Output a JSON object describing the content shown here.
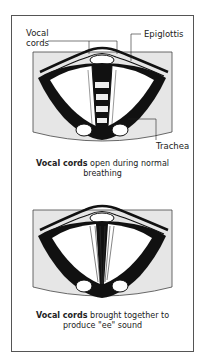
{
  "figure": {
    "panels": [
      {
        "name": "open",
        "labels": {
          "vocal_cords_line1": "Vocal",
          "vocal_cords_line2": "cords",
          "epiglottis": "Epiglottis",
          "trachea": "Trachea"
        },
        "caption": {
          "bold": "Vocal cords",
          "rest": " open during normal",
          "line2": "breathing"
        }
      },
      {
        "name": "closed",
        "caption": {
          "bold": "Vocal cords",
          "rest": " brought together to",
          "line2": "produce \"ee\" sound"
        }
      }
    ],
    "colors": {
      "panel_bg": "#e6e6e6",
      "ink": "#1a1a1a",
      "frame": "#555555"
    }
  }
}
